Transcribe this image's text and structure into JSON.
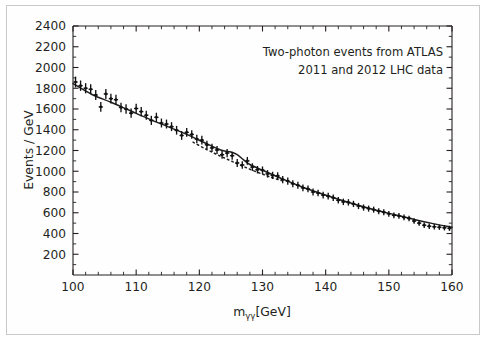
{
  "figure": {
    "name": "atlas-diphoton-mass-spectrum",
    "border_color": "#c9c9c9",
    "background": "#ffffff"
  },
  "chart_data": {
    "type": "scatter",
    "title": "",
    "xlabel_main": "m",
    "xlabel_sub": "γγ",
    "xlabel_units": "[GeV]",
    "xlabel": "mγγ [GeV]",
    "ylabel": "Events / GeV",
    "xlim": [
      100,
      160
    ],
    "ylim": [
      0,
      2400
    ],
    "xticks": [
      100,
      110,
      120,
      130,
      140,
      150,
      160
    ],
    "xtick_labels": [
      "100",
      "110",
      "120",
      "130",
      "140",
      "150",
      "160"
    ],
    "x_minor_step": 2,
    "yticks": [
      200,
      400,
      600,
      800,
      1000,
      1200,
      1400,
      1600,
      1800,
      2000,
      2200,
      2400
    ],
    "ytick_labels": [
      "200",
      "400",
      "600",
      "800",
      "1000",
      "1200",
      "1400",
      "1600",
      "1800",
      "2000",
      "2200",
      "2400"
    ],
    "y_minor_step": 100,
    "grid": false,
    "legend": "none",
    "marker": "cross",
    "marker_color": "#111111",
    "line_color": "#111111",
    "annotations": [
      "Two-photon events from ATLAS",
      "2011 and 2012 LHC data"
    ],
    "annotation_align": "right",
    "series": [
      {
        "name": "data",
        "kind": "points",
        "x": [
          100.4,
          101.2,
          102.0,
          102.8,
          103.6,
          104.4,
          105.2,
          106.0,
          106.8,
          107.6,
          108.4,
          109.2,
          110.0,
          110.8,
          111.6,
          112.4,
          113.2,
          114.0,
          114.8,
          115.6,
          116.4,
          117.2,
          118.0,
          118.8,
          119.6,
          120.4,
          121.2,
          122.0,
          122.8,
          123.6,
          124.4,
          125.2,
          126.0,
          126.8,
          127.6,
          128.4,
          129.2,
          130.0,
          130.8,
          131.6,
          132.4,
          133.2,
          134.0,
          134.8,
          135.6,
          136.4,
          137.2,
          138.0,
          138.8,
          139.6,
          140.4,
          141.2,
          142.0,
          142.8,
          143.6,
          144.4,
          145.2,
          146.0,
          146.8,
          147.6,
          148.4,
          149.2,
          150.0,
          150.8,
          151.6,
          152.4,
          153.2,
          154.0,
          154.8,
          155.6,
          156.4,
          157.2,
          158.0,
          158.8,
          159.6
        ],
        "y": [
          1860,
          1825,
          1800,
          1790,
          1735,
          1620,
          1745,
          1700,
          1690,
          1615,
          1600,
          1560,
          1605,
          1575,
          1540,
          1490,
          1520,
          1465,
          1455,
          1430,
          1395,
          1345,
          1375,
          1355,
          1310,
          1300,
          1255,
          1225,
          1205,
          1160,
          1175,
          1150,
          1080,
          1060,
          1100,
          1040,
          1015,
          1010,
          975,
          960,
          955,
          920,
          905,
          880,
          865,
          840,
          830,
          800,
          790,
          770,
          760,
          745,
          720,
          705,
          700,
          685,
          665,
          650,
          640,
          630,
          615,
          605,
          590,
          575,
          570,
          555,
          545,
          520,
          500,
          480,
          470,
          465,
          460,
          455,
          450
        ],
        "yerr": [
          52,
          50,
          49,
          49,
          48,
          47,
          48,
          47,
          47,
          46,
          45,
          45,
          45,
          45,
          44,
          44,
          44,
          43,
          43,
          43,
          42,
          42,
          42,
          41,
          41,
          41,
          40,
          40,
          39,
          39,
          39,
          38,
          38,
          37,
          38,
          37,
          36,
          36,
          36,
          35,
          35,
          35,
          34,
          34,
          34,
          33,
          33,
          33,
          32,
          32,
          32,
          31,
          31,
          31,
          31,
          30,
          30,
          30,
          29,
          29,
          29,
          29,
          28,
          28,
          28,
          27,
          27,
          27,
          26,
          26,
          26,
          26,
          25,
          25,
          25
        ]
      },
      {
        "name": "signal-plus-background-fit",
        "kind": "solid-line",
        "x": [
          100,
          103,
          106,
          109,
          112,
          115,
          118,
          121,
          123,
          124,
          125,
          126,
          127,
          128,
          130,
          133,
          136,
          139,
          142,
          145,
          148,
          151,
          154,
          157,
          160
        ],
        "y": [
          1845,
          1740,
          1665,
          1585,
          1505,
          1430,
          1355,
          1270,
          1215,
          1195,
          1185,
          1160,
          1110,
          1065,
          1010,
          930,
          855,
          790,
          730,
          675,
          625,
          580,
          535,
          495,
          460
        ]
      },
      {
        "name": "background-only-fit",
        "kind": "dotted-line",
        "x": [
          119,
          121,
          123,
          125,
          127,
          129,
          131,
          133
        ],
        "y": [
          1280,
          1215,
          1155,
          1100,
          1045,
          995,
          950,
          910
        ]
      }
    ]
  }
}
